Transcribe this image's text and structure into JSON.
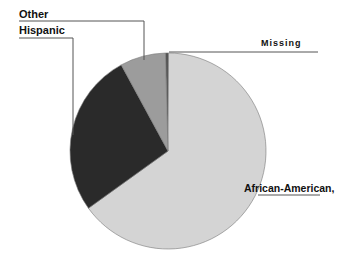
{
  "chart_data": {
    "type": "pie",
    "title": "",
    "categories": [
      "African-American,",
      "Hispanic",
      "Other",
      "Missing"
    ],
    "values": [
      65,
      27,
      7.5,
      0.5
    ],
    "unit": "percent (estimated)",
    "start_angle_deg": -90,
    "direction": "clockwise",
    "slice_order_from_top_clockwise": [
      "Missing",
      "African-American,",
      "Hispanic",
      "Other"
    ],
    "colors": {
      "African-American,": "#d4d4d4",
      "Hispanic": "#2a2a2a",
      "Other": "#9c9c9c",
      "Missing": "#555555"
    },
    "legend": "none (callout labels with leader lines)"
  },
  "labels": {
    "other": "Other",
    "hispanic": "Hispanic",
    "missing": "Missing",
    "african_american": "African-American,"
  }
}
